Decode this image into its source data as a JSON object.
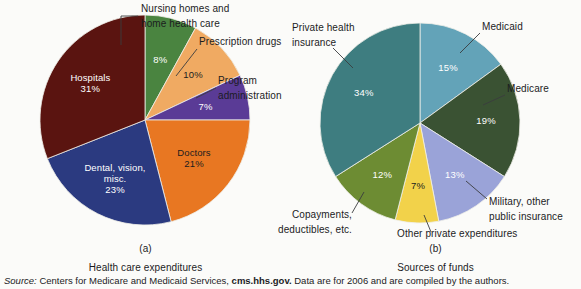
{
  "background_color": "#fbfbf9",
  "source": {
    "label": "Source:",
    "body_before": " Centers for Medicare and Medicaid Services, ",
    "site": "cms.hhs.gov.",
    "body_after": " Data are for 2006 and are compiled by the authors."
  },
  "panels": [
    {
      "letter": "(a)",
      "title": "Health care expenditures"
    },
    {
      "letter": "(b)",
      "title": "Sources of funds"
    }
  ],
  "chart_data": [
    {
      "type": "pie",
      "title": "Health care expenditures",
      "panel": "(a)",
      "start_angle_deg": 0,
      "direction": "clockwise",
      "categories": [
        "Nursing homes and home health care",
        "Prescription drugs",
        "Program administration",
        "Doctors",
        "Dental, vision, misc.",
        "Hospitals"
      ],
      "values": [
        8,
        10,
        7,
        21,
        23,
        31
      ],
      "value_labels": [
        "8%",
        "10%",
        "7%",
        "21%",
        "23%",
        "31%"
      ],
      "colors": [
        "#4a8440",
        "#f0aa62",
        "#5a3b96",
        "#e87722",
        "#2b3a80",
        "#5a1410"
      ],
      "value_label_colors": [
        "#ffffff",
        "#1b1c1e",
        "#ffffff",
        "#1b1c1e",
        "#ffffff",
        "#ffffff"
      ],
      "inside_labels": [
        {
          "name": "",
          "value": "8%"
        },
        {
          "name": "",
          "value": "10%"
        },
        {
          "name": "",
          "value": "7%"
        },
        {
          "name": "Doctors",
          "value": "21%"
        },
        {
          "name": "Dental, vision,\nmisc.",
          "value": "23%"
        },
        {
          "name": "Hospitals",
          "value": "31%"
        }
      ],
      "callouts": [
        {
          "lines": [
            "Nursing homes and",
            "home health care"
          ]
        },
        {
          "lines": [
            "Prescription drugs"
          ]
        },
        {
          "lines": [
            "Program",
            "administration"
          ]
        }
      ]
    },
    {
      "type": "pie",
      "title": "Sources of funds",
      "panel": "(b)",
      "start_angle_deg": 0,
      "direction": "clockwise",
      "categories": [
        "Medicaid",
        "Medicare",
        "Military, other public insurance",
        "Other private expenditures",
        "Copayments, deductibles, etc.",
        "Private health insurance"
      ],
      "values": [
        15,
        19,
        13,
        7,
        12,
        34
      ],
      "value_labels": [
        "15%",
        "19%",
        "13%",
        "7%",
        "12%",
        "34%"
      ],
      "colors": [
        "#63a3b8",
        "#3a5233",
        "#9aa3d8",
        "#f2d24a",
        "#6d8c33",
        "#3e7d80"
      ],
      "value_label_colors": [
        "#ffffff",
        "#ffffff",
        "#ffffff",
        "#1b1c1e",
        "#ffffff",
        "#ffffff"
      ],
      "callouts": [
        {
          "lines": [
            "Medicaid"
          ]
        },
        {
          "lines": [
            "Medicare"
          ]
        },
        {
          "lines": [
            "Military, other",
            "public insurance"
          ]
        },
        {
          "lines": [
            "Other private expenditures"
          ]
        },
        {
          "lines": [
            "Copayments,",
            "deductibles, etc."
          ]
        },
        {
          "lines": [
            "Private health",
            "insurance"
          ]
        }
      ]
    }
  ]
}
